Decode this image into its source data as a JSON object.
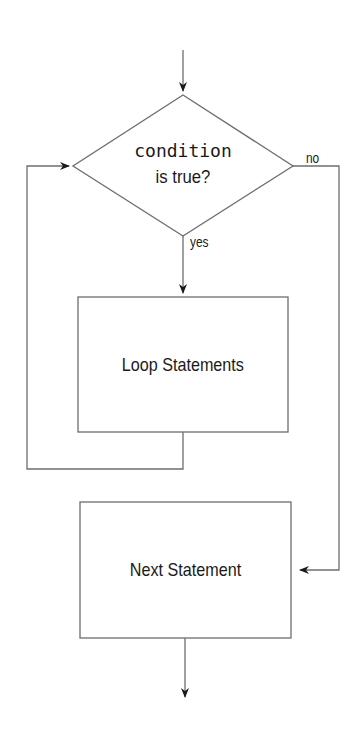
{
  "diagram": {
    "type": "flowchart",
    "title": "",
    "nodes": [
      {
        "id": "decision",
        "shape": "diamond",
        "line1": "condition",
        "line2": "is true?"
      },
      {
        "id": "loop",
        "shape": "rect",
        "label": "Loop Statements"
      },
      {
        "id": "next",
        "shape": "rect",
        "label": "Next Statement"
      }
    ],
    "edges": [
      {
        "from": "entry",
        "to": "decision",
        "label": ""
      },
      {
        "from": "decision",
        "to": "loop",
        "label": "yes"
      },
      {
        "from": "loop",
        "to": "decision",
        "label": ""
      },
      {
        "from": "decision",
        "to": "next",
        "label": "no"
      },
      {
        "from": "next",
        "to": "exit",
        "label": ""
      }
    ],
    "colors": {
      "line": "#6e6e6e",
      "arrow": "#1a1a1a",
      "text": "#1a1a1a",
      "background": "#ffffff"
    }
  }
}
